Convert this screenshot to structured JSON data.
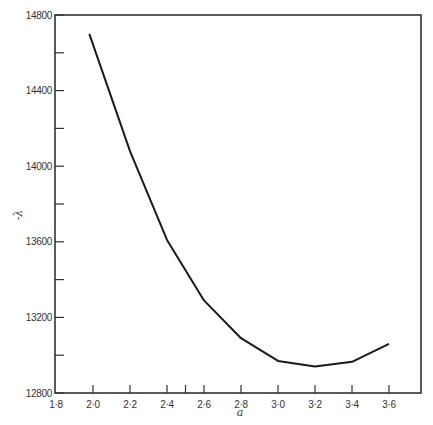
{
  "chart_data": {
    "type": "line",
    "title": "",
    "xlabel": "a",
    "ylabel": "-λ",
    "xlim": [
      1.8,
      3.6
    ],
    "ylim": [
      12800,
      14800
    ],
    "x_ticks": [
      1.8,
      2.0,
      2.2,
      2.4,
      2.6,
      2.8,
      3.0,
      3.2,
      3.4,
      3.6
    ],
    "x_tick_labels": [
      "1·8",
      "2·0",
      "2·2",
      "2·4",
      "2·6",
      "2·8",
      "3·0",
      "3·2",
      "3·4",
      "3·6"
    ],
    "x_extra_ticks": [
      2.5
    ],
    "y_ticks": [
      12800,
      13200,
      13600,
      14000,
      14400,
      14800
    ],
    "y_tick_labels": [
      "12800",
      "13200",
      "13600",
      "14000",
      "14400",
      "14800"
    ],
    "y_minor_ticks": [
      13000,
      13400,
      13800,
      14200,
      14600
    ],
    "grid": false,
    "legend": null,
    "series": [
      {
        "name": "-λ vs a",
        "x": [
          1.98,
          2.2,
          2.4,
          2.6,
          2.8,
          3.0,
          3.2,
          3.4,
          3.6
        ],
        "values": [
          14700,
          14080,
          13610,
          13290,
          13090,
          12970,
          12940,
          12965,
          13060
        ]
      }
    ]
  },
  "style": {
    "line_color": "#1a1a1a",
    "axis_color": "#333333"
  }
}
